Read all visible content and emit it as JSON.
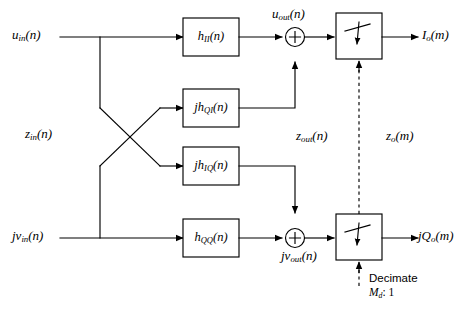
{
  "diagram": {
    "colors": {
      "line": "#000000",
      "box_fill": "#ffffff",
      "background": "#ffffff"
    },
    "inputs": [
      {
        "id": "u_in",
        "label_html": "u<sub>in</sub>(n)",
        "text": "u_in(n)"
      },
      {
        "id": "jv_in",
        "label_html": "jv<sub>in</sub>(n)",
        "text": "jv_in(n)"
      }
    ],
    "outputs": [
      {
        "id": "I_o",
        "label_html": "I<sub>o</sub>(m)",
        "text": "I_o(m)"
      },
      {
        "id": "jQ_o",
        "label_html": "jQ<sub>o</sub>(m)",
        "text": "jQ_o(m)"
      }
    ],
    "filters": [
      {
        "id": "h_II",
        "label_html": "h<sub>II</sub>(n)",
        "text": "h_II(n)"
      },
      {
        "id": "jh_QI",
        "label_html": "jh<sub>QI</sub>(n)",
        "text": "jh_QI(n)"
      },
      {
        "id": "jh_IQ",
        "label_html": "jh<sub>IQ</sub>(n)",
        "text": "jh_IQ(n)"
      },
      {
        "id": "h_QQ",
        "label_html": "h<sub>QQ</sub>(n)",
        "text": "h_QQ(n)"
      }
    ],
    "adders": [
      {
        "id": "adder-top",
        "symbol": "+"
      },
      {
        "id": "adder-bottom",
        "symbol": "+"
      }
    ],
    "signal_labels": [
      {
        "id": "z_in",
        "label_html": "z<sub>in</sub>(n)",
        "text": "z_in(n)"
      },
      {
        "id": "u_out",
        "label_html": "u<sub>out</sub>(n)",
        "text": "u_out(n)"
      },
      {
        "id": "z_out",
        "label_html": "z<sub>out</sub>(n)",
        "text": "z_out(n)"
      },
      {
        "id": "z_o",
        "label_html": "z<sub>o</sub>(m)",
        "text": "z_o(m)"
      },
      {
        "id": "jv_out",
        "label_html": "jv<sub>out</sub>(n)",
        "text": "jv_out(n)"
      }
    ],
    "decimators": [
      {
        "id": "decimator-top",
        "type": "switch"
      },
      {
        "id": "decimator-bottom",
        "type": "switch"
      }
    ],
    "control": {
      "line1": "Decimate",
      "line2_html": "M<sub>d</sub>: 1",
      "line2_text": "M_d: 1",
      "factor_symbol": "M_d",
      "ratio": "1"
    }
  }
}
